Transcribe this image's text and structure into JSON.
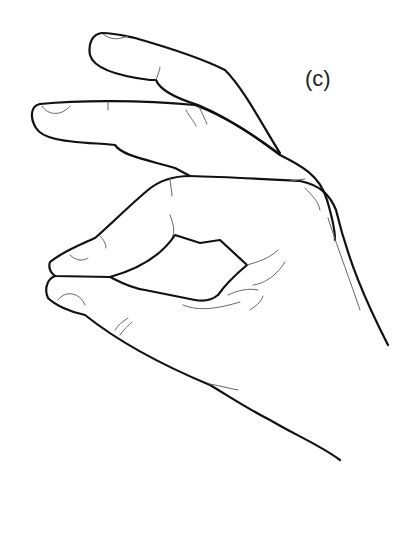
{
  "figure": {
    "label": "(c)",
    "stroke_color": "#111111",
    "background": "#ffffff"
  }
}
